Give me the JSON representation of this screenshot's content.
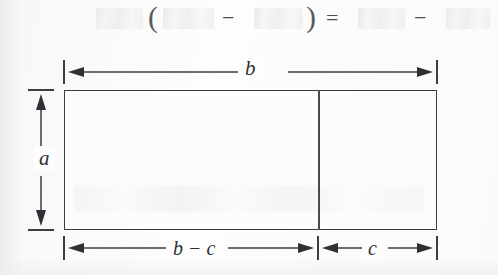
{
  "figure": {
    "caption_equation": {
      "visible_glyphs": {
        "open_paren": "(",
        "minus_inside": "−",
        "close_paren": ")",
        "equals": "=",
        "minus_outside": "−"
      },
      "faded_terms": [
        {
          "name": "left-factor",
          "text": ""
        },
        {
          "name": "first-term-in-parens",
          "text": ""
        },
        {
          "name": "second-term-in-parens",
          "text": ""
        },
        {
          "name": "first-product",
          "text": ""
        },
        {
          "name": "second-product",
          "text": ""
        }
      ]
    },
    "diagram": {
      "top_dimension_label": "b",
      "left_dimension_label": "a",
      "bottom_left_dimension_label": "b − c",
      "bottom_right_dimension_label": "c"
    },
    "colors": {
      "ink": "#3c3d43",
      "ink_dark": "#2d2e33",
      "faded_ink": "#55565c",
      "paper": "#fdfdfd",
      "rect_fill": "#fcfcfc"
    }
  }
}
